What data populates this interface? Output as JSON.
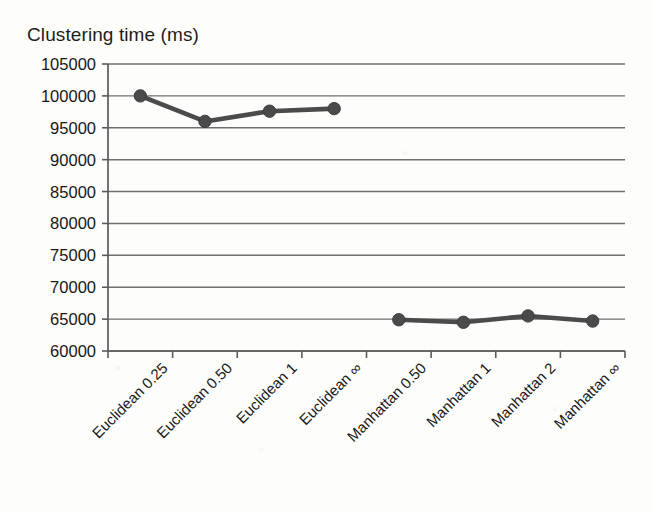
{
  "chart_data": {
    "type": "line",
    "title": "Clustering time (ms)",
    "xlabel": "",
    "ylabel": "Clustering time (ms)",
    "categories": [
      "Euclidean 0.25",
      "Euclidean 0.50",
      "Euclidean 1",
      "Euclidean ∞",
      "Manhattan 0.50",
      "Manhattan 1",
      "Manhattan 2",
      "Manhattan ∞"
    ],
    "values": [
      100000,
      96000,
      97600,
      98000,
      64900,
      64500,
      65500,
      64700
    ],
    "series": [
      {
        "name": "Clustering time",
        "values": [
          100000,
          96000,
          97600,
          98000,
          64900,
          64500,
          65500,
          64700
        ]
      }
    ],
    "segments": [
      {
        "name": "Euclidean",
        "start_index": 0,
        "end_index": 3
      },
      {
        "name": "Manhattan",
        "start_index": 4,
        "end_index": 7
      }
    ],
    "ylim": [
      60000,
      105000
    ],
    "ytick_step": 5000,
    "ytick_labels": [
      "105000",
      "100000",
      "95000",
      "90000",
      "85000",
      "80000",
      "75000",
      "70000",
      "65000",
      "60000"
    ],
    "grid": true,
    "grid_axis": "y",
    "legend": "none",
    "marker": "circle",
    "xlabel_rotation_deg": -45,
    "colors": {
      "series": "#4a4a4a",
      "grid": "#6f6f6f",
      "axis": "#5a5a5a",
      "text": "#1a1a1a",
      "background": "#fdfdfc"
    }
  }
}
